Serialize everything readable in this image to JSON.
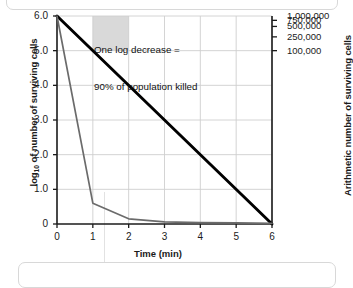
{
  "chart_data": {
    "type": "line",
    "title": "",
    "xlabel": "Time (min)",
    "ylabel_left": "log10 of number of surviving cells",
    "ylabel_right": "Arithmetic number of surviving cells",
    "xlim": [
      0,
      6
    ],
    "ylim": [
      0,
      6
    ],
    "grid": true,
    "legend": "none",
    "xticks": [
      "0",
      "1",
      "2",
      "3",
      "4",
      "5",
      "6"
    ],
    "xtick_values": [
      0,
      1,
      2,
      3,
      4,
      5,
      6
    ],
    "yticks_left": [
      "6.0",
      "5.0",
      "4.0",
      "3.0",
      "2.0",
      "1.0",
      "0"
    ],
    "ytick_values_left": [
      6.0,
      5.0,
      4.0,
      3.0,
      2.0,
      1.0,
      0
    ],
    "yticks_right": [
      "1,000,000",
      "750,000",
      "500,000",
      "250,000",
      "100,000"
    ],
    "ytick_values_right_log": [
      6.0,
      5.875,
      5.699,
      5.398,
      5.0
    ],
    "series": [
      {
        "name": "logarithmic-death-line",
        "style": "thick-black",
        "color": "#000000",
        "x": [
          0,
          6
        ],
        "values": [
          6.0,
          0.0
        ]
      },
      {
        "name": "arithmetic-decline-curve",
        "style": "thin-gray",
        "color": "#6b6b6b",
        "x": [
          0,
          1,
          2,
          3,
          4,
          5,
          6
        ],
        "values": [
          6.0,
          0.6,
          0.15,
          0.06,
          0.04,
          0.03,
          0.02
        ]
      }
    ],
    "annotations": [
      {
        "name": "one-log-decrease-note",
        "line1": "One log decrease =",
        "line2": "90% of population killed",
        "x": 1.05,
        "y": 5.95
      },
      {
        "name": "one-log-shaded-region",
        "type": "rect",
        "x0": 1.0,
        "x1": 2.0,
        "y0": 5.0,
        "y1": 6.0,
        "color": "#d9d9d9"
      }
    ],
    "colors": {
      "axis": "#1b1b1b",
      "grid": "#cfcfcf",
      "thick_line": "#000000",
      "thin_line": "#6b6b6b",
      "shade": "#d9d9d9",
      "background": "#ffffff"
    }
  }
}
